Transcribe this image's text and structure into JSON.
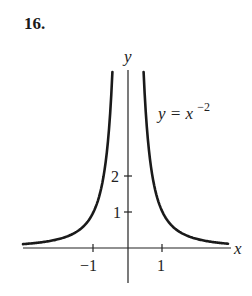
{
  "problem_number": "16.",
  "chart_data": {
    "type": "line",
    "title": "",
    "equation_label": "y = x^-2",
    "equation_base": "y = x",
    "equation_exponent": "−2",
    "xlabel": "x",
    "ylabel": "y",
    "x_ticks": [
      {
        "value": -1,
        "label": "−1"
      },
      {
        "value": 1,
        "label": "1"
      }
    ],
    "y_ticks": [
      {
        "value": 1,
        "label": "1"
      },
      {
        "value": 2,
        "label": "2"
      }
    ],
    "xlim": [
      -3.0,
      2.9
    ],
    "ylim": [
      -0.8,
      4.9
    ],
    "grid": false,
    "legend": "none",
    "series": [
      {
        "name": "y = x^-2",
        "x": [
          -3.0,
          -2.0,
          -1.5,
          -1.0,
          -0.8,
          -0.6,
          -0.5,
          0.5,
          0.6,
          0.8,
          1.0,
          1.5,
          2.0,
          2.9
        ],
        "values": [
          0.11,
          0.25,
          0.44,
          1.0,
          1.56,
          2.78,
          4.0,
          4.0,
          2.78,
          1.56,
          1.0,
          0.44,
          0.25,
          0.12
        ]
      }
    ]
  }
}
